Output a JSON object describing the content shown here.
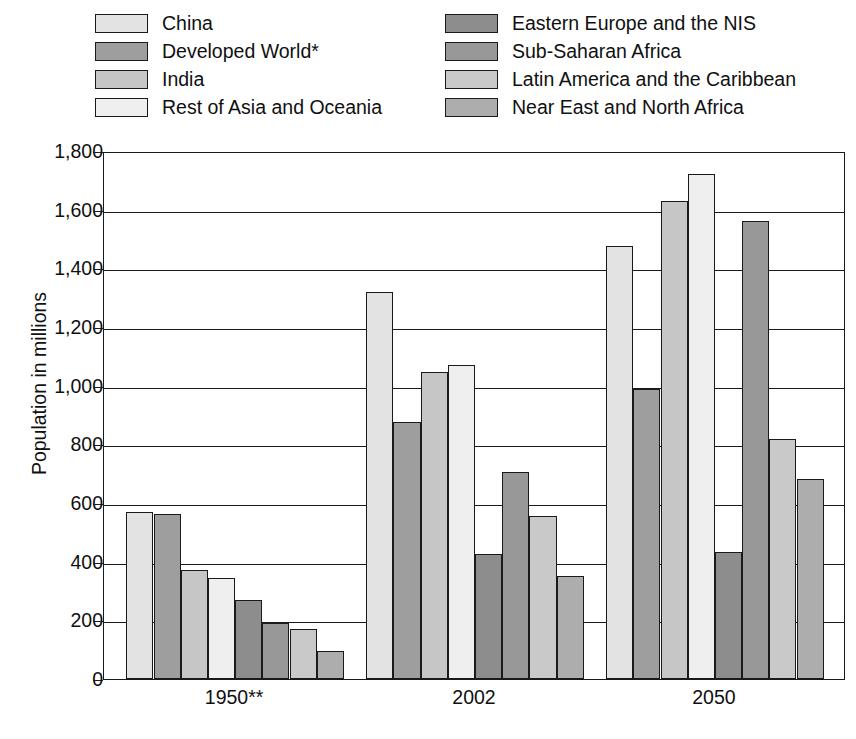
{
  "legend": {
    "columns": [
      {
        "items": [
          {
            "label": "China",
            "color": "#e3e3e3"
          },
          {
            "label": "Developed World*",
            "color": "#9e9e9e"
          },
          {
            "label": "India",
            "color": "#c6c6c6"
          },
          {
            "label": "Rest of Asia and Oceania",
            "color": "#efefef"
          }
        ]
      },
      {
        "items": [
          {
            "label": "Eastern Europe and the NIS",
            "color": "#8d8d8d"
          },
          {
            "label": "Sub-Saharan Africa",
            "color": "#989898"
          },
          {
            "label": "Latin America and the Caribbean",
            "color": "#c9c9c9"
          },
          {
            "label": "Near East and North Africa",
            "color": "#adadad"
          }
        ]
      }
    ]
  },
  "chart_data": {
    "type": "bar",
    "title": "",
    "xlabel": "",
    "ylabel": "Population in millions",
    "ylim": [
      0,
      1800
    ],
    "ytick_labels": [
      "1,800",
      "1,600",
      "1,400",
      "1,200",
      "1,000",
      "800",
      "600",
      "400",
      "200",
      "0"
    ],
    "ytick_values": [
      1800,
      1600,
      1400,
      1200,
      1000,
      800,
      600,
      400,
      200,
      0
    ],
    "grid": true,
    "legend_position": "top",
    "categories": [
      "1950**",
      "2002",
      "2050"
    ],
    "series": [
      {
        "name": "China",
        "color": "#e3e3e3",
        "values": [
          570,
          1320,
          1477
        ]
      },
      {
        "name": "Developed World*",
        "color": "#9e9e9e",
        "values": [
          563,
          875,
          988
        ]
      },
      {
        "name": "India",
        "color": "#c6c6c6",
        "values": [
          370,
          1048,
          1628
        ]
      },
      {
        "name": "Rest of Asia and Oceania",
        "color": "#efefef",
        "values": [
          345,
          1070,
          1720
        ]
      },
      {
        "name": "Eastern Europe and the NIS",
        "color": "#8d8d8d",
        "values": [
          270,
          427,
          432
        ]
      },
      {
        "name": "Sub-Saharan Africa",
        "color": "#989898",
        "values": [
          192,
          705,
          1563
        ]
      },
      {
        "name": "Latin America and the Caribbean",
        "color": "#c9c9c9",
        "values": [
          172,
          556,
          817
        ]
      },
      {
        "name": "Near East and North Africa",
        "color": "#adadad",
        "values": [
          95,
          352,
          683
        ]
      }
    ]
  }
}
